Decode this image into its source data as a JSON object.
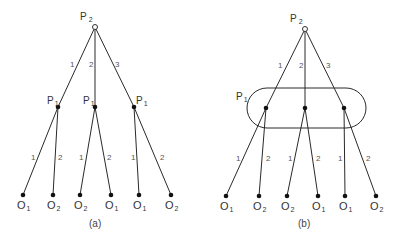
{
  "figure": {
    "panels": [
      {
        "id": "a",
        "caption": "(a)",
        "root": {
          "player": "P",
          "sub": "2",
          "x": 95,
          "y": 27,
          "label_x": 80,
          "label_y": 20
        },
        "root_moves": [
          "1",
          "2",
          "3"
        ],
        "p1_nodes": [
          {
            "player": "P",
            "sub": "1",
            "x": 58,
            "y": 107,
            "label_x": 47,
            "label_y": 103
          },
          {
            "player": "P",
            "sub": "1",
            "x": 95,
            "y": 107,
            "label_x": 83,
            "label_y": 103
          },
          {
            "player": "P",
            "sub": "1",
            "x": 134,
            "y": 107,
            "label_x": 137,
            "label_y": 103
          }
        ],
        "p1_moves": [
          "1",
          "2"
        ],
        "outcomes": [
          {
            "label": "O",
            "sub": "1",
            "x": 23,
            "y": 195
          },
          {
            "label": "O",
            "sub": "2",
            "x": 53,
            "y": 195
          },
          {
            "label": "O",
            "sub": "2",
            "x": 80,
            "y": 195
          },
          {
            "label": "O",
            "sub": "1",
            "x": 111,
            "y": 195
          },
          {
            "label": "O",
            "sub": "1",
            "x": 139,
            "y": 195
          },
          {
            "label": "O",
            "sub": "2",
            "x": 171,
            "y": 195
          }
        ],
        "info_set": false
      },
      {
        "id": "b",
        "caption": "(b)",
        "root": {
          "player": "P",
          "sub": "2",
          "x": 305,
          "y": 29,
          "label_x": 290,
          "label_y": 21
        },
        "root_moves": [
          "1",
          "2",
          "3"
        ],
        "p1_nodes": [
          {
            "player": "P",
            "sub": "1",
            "x": 266,
            "y": 108
          },
          {
            "player": "P",
            "sub": "1",
            "x": 305,
            "y": 108
          },
          {
            "player": "P",
            "sub": "1",
            "x": 344,
            "y": 108
          }
        ],
        "info_set_label": {
          "player": "P",
          "sub": "1",
          "x": 236,
          "y": 100
        },
        "p1_moves": [
          "1",
          "2"
        ],
        "outcomes": [
          {
            "label": "O",
            "sub": "1",
            "x": 226,
            "y": 196
          },
          {
            "label": "O",
            "sub": "2",
            "x": 259,
            "y": 196
          },
          {
            "label": "O",
            "sub": "2",
            "x": 287,
            "y": 196
          },
          {
            "label": "O",
            "sub": "1",
            "x": 318,
            "y": 196
          },
          {
            "label": "O",
            "sub": "1",
            "x": 345,
            "y": 196
          },
          {
            "label": "O",
            "sub": "2",
            "x": 376,
            "y": 196
          }
        ],
        "info_set": true
      }
    ]
  },
  "text": {
    "a_caption": "(a)",
    "b_caption": "(b)",
    "P": "P",
    "O": "O",
    "one": "1",
    "two": "2",
    "three": "3"
  }
}
